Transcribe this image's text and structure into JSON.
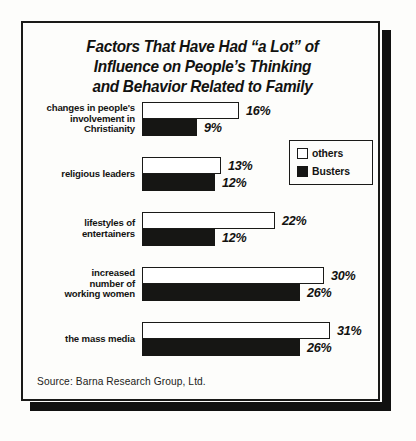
{
  "chart_data": {
    "type": "bar",
    "orientation": "horizontal",
    "title": "Factors That Have Had “a Lot” of Influence on People’s Thinking and Behavior Related to Family",
    "title_lines": [
      "Factors That Have Had “a Lot” of",
      "Influence on People’s Thinking",
      "and Behavior Related to Family"
    ],
    "categories": [
      "changes in people's involvement in Christianity",
      "religious leaders",
      "lifestyles of entertainers",
      "increased number of working women",
      "the mass media"
    ],
    "category_lines": [
      [
        "changes in people's",
        "involvement in",
        "Christianity"
      ],
      [
        "religious leaders"
      ],
      [
        "lifestyles of",
        "entertainers"
      ],
      [
        "increased",
        "number of",
        "working women"
      ],
      [
        "the mass media"
      ]
    ],
    "series": [
      {
        "name": "others",
        "color": "#ffffff",
        "values": [
          16,
          13,
          22,
          30,
          31
        ],
        "labels": [
          "16%",
          "13%",
          "22%",
          "30%",
          "31%"
        ]
      },
      {
        "name": "Busters",
        "color": "#161614",
        "values": [
          9,
          12,
          12,
          26,
          26
        ],
        "labels": [
          "9%",
          "12%",
          "12%",
          "26%",
          "26%"
        ]
      }
    ],
    "xlabel": "",
    "ylabel": "",
    "xlim": [
      0,
      31
    ],
    "grid": false,
    "legend_position": "upper-right",
    "value_unit": "percent"
  },
  "legend": {
    "items": [
      {
        "label": "others",
        "swatch": "others"
      },
      {
        "label": "Busters",
        "swatch": "busters"
      }
    ]
  },
  "footer": {
    "source": "Source: Barna Research Group, Ltd."
  },
  "colors": {
    "ink": "#161614",
    "paper": "#fdfdfb",
    "frame": "#1a1a18"
  }
}
